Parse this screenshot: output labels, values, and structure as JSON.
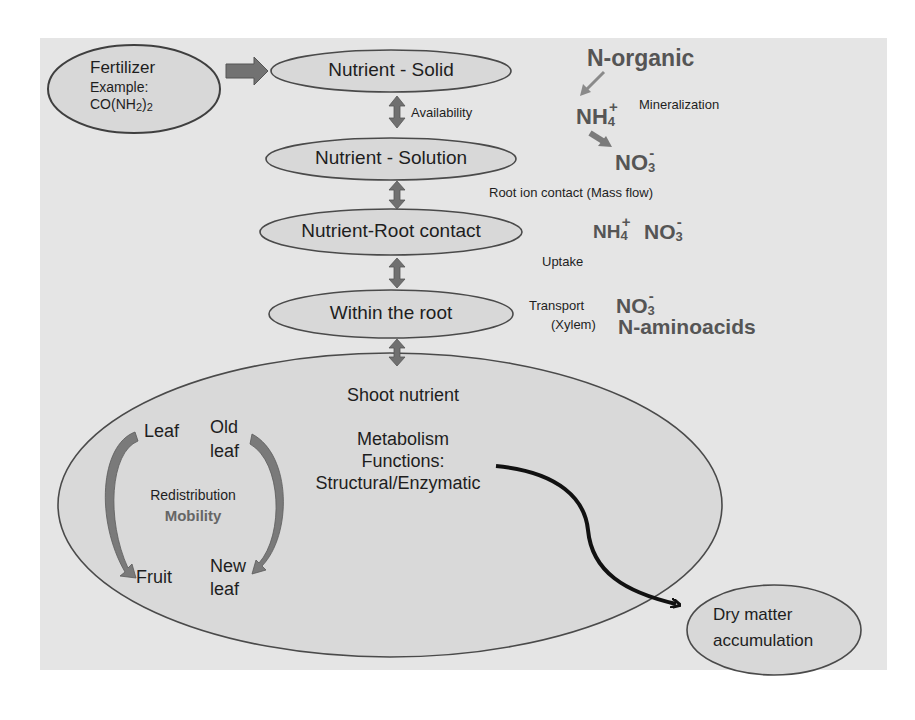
{
  "diagram": {
    "colors": {
      "panel_bg": "#e5e5e5",
      "ellipse_fill": "#d8d8d8",
      "ellipse_stroke": "#4a4a4a",
      "arrow_gray": "#707070",
      "arrow_black": "#111111",
      "chem_text": "#555555"
    },
    "fertilizer": {
      "line1": "Fertilizer",
      "line2": "Example:",
      "formula_a": "CO(NH",
      "formula_sub1": "2",
      "formula_b": ")",
      "formula_sub2": "2"
    },
    "chain": [
      {
        "label": "Nutrient - Solid"
      },
      {
        "label": "Nutrient - Solution"
      },
      {
        "label": "Nutrient-Root contact"
      },
      {
        "label": "Within the root"
      }
    ],
    "chain_links": {
      "availability": "Availability"
    },
    "right_side": {
      "n_organic": "N-organic",
      "mineralization": "Mineralization",
      "nh4_base": "NH",
      "nh4_sub": "4",
      "nh4_charge": "+",
      "no3_base": "NO",
      "no3_sub": "3",
      "no3_charge": "-",
      "root_ion_contact": "Root ion contact  (Mass flow)",
      "uptake": "Uptake",
      "transport": "Transport",
      "xylem": "(Xylem)",
      "n_aminoacids": "N-aminoacids"
    },
    "shoot": {
      "title": "Shoot nutrient",
      "metabolism": "Metabolism",
      "functions": "Functions:",
      "structural": "Structural/Enzymatic",
      "leaf": "Leaf",
      "old_leaf_1": "Old",
      "old_leaf_2": "leaf",
      "redistribution": "Redistribution",
      "mobility": "Mobility",
      "fruit": "Fruit",
      "new_leaf_1": "New",
      "new_leaf_2": "leaf"
    },
    "output": {
      "line1": "Dry matter",
      "line2": "accumulation"
    }
  }
}
